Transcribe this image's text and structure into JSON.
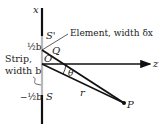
{
  "diagram": {
    "type": "single-slit diffraction geometry",
    "axes": {
      "vertical_label": "x",
      "horizontal_label": "z"
    },
    "points": {
      "top_edge": "S'",
      "bottom_edge": "S",
      "element_point": "Q",
      "origin": "O",
      "observation_point": "P"
    },
    "labels": {
      "element": "Element, width δx",
      "strip_line1": "Strip,",
      "strip_line2": "width b",
      "half_b_top": "½b",
      "half_b_bottom": "−½b",
      "distance": "r",
      "angle": "θ"
    },
    "colors": {
      "line": "#111111",
      "strip": "#b8b8b8",
      "text": "#222222"
    }
  }
}
